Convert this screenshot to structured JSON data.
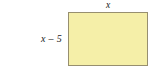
{
  "figure": {
    "type": "geometry-diagram",
    "shape": "rectangle",
    "background_color": "#ffffff",
    "rectangle": {
      "fill_color": "#f5efa8",
      "border_color": "#978f6f",
      "x": 68,
      "y": 12,
      "width": 80,
      "height": 54
    },
    "labels": {
      "top": "x",
      "left": "x – 5"
    }
  }
}
